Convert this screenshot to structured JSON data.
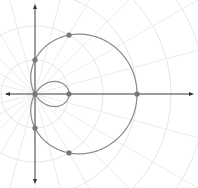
{
  "diagram": {
    "type": "polar-graph",
    "curve": "limacon with inner loop",
    "equation": "r = 1 + 2cos(theta)",
    "a": 1,
    "b": 2,
    "origin_px": [
      35,
      94
    ],
    "px_per_unit": 34,
    "grid": {
      "circle_radii_units": [
        1,
        2,
        3,
        4,
        5,
        6
      ],
      "ray_step_degrees": 15
    },
    "colors": {
      "curve": "#8a8a8a",
      "points": "#777777",
      "axes": "#444444",
      "grid": "#e6e6e6"
    },
    "marked_points_polar": [
      {
        "theta_deg": 0,
        "r": 3
      },
      {
        "theta_deg": 60,
        "r": 2
      },
      {
        "theta_deg": 90,
        "r": 1
      },
      {
        "theta_deg": 120,
        "r": 0
      },
      {
        "theta_deg": 180,
        "r": -1
      },
      {
        "theta_deg": 270,
        "r": 1
      },
      {
        "theta_deg": 300,
        "r": 2
      }
    ]
  }
}
